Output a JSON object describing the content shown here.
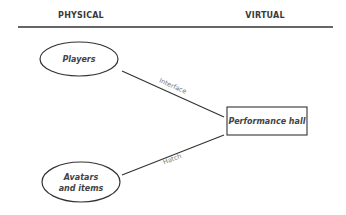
{
  "header": {
    "left_label": "PHYSICAL",
    "right_label": "VIRTUAL"
  },
  "nodes": {
    "players": "Players",
    "avatars_line1": "Avatars",
    "avatars_line2": "and items",
    "performance_hall": "Performance hall"
  },
  "edges": {
    "interface": "Interface",
    "hatch": "Hatch"
  },
  "colors": {
    "stroke": "#333333",
    "text": "#444444",
    "edge_text": "#777777"
  }
}
